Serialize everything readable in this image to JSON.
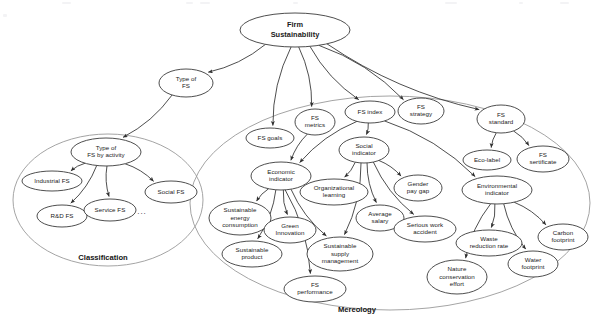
{
  "diagram": {
    "type": "ontology-concept-map",
    "root": {
      "id": "firm-sustainability",
      "label_line1": "Firm",
      "label_line2": "Sustainability"
    },
    "groups": [
      {
        "id": "classification",
        "label": "Classification"
      },
      {
        "id": "mereology",
        "label": "Mereology"
      }
    ],
    "ellipsis": "...",
    "nodes": [
      {
        "id": "firm-sustainability",
        "lines": [
          "Firm",
          "Sustainability"
        ],
        "cx": 295,
        "cy": 30,
        "rx": 55,
        "ry": 17,
        "bold": true
      },
      {
        "id": "type-of-fs",
        "lines": [
          "Type of",
          "FS"
        ],
        "cx": 186,
        "cy": 83,
        "rx": 27,
        "ry": 14
      },
      {
        "id": "type-of-fs-by-activity",
        "lines": [
          "Type of",
          "FS by activity"
        ],
        "cx": 106,
        "cy": 152,
        "rx": 35,
        "ry": 14
      },
      {
        "id": "industrial-fs",
        "lines": [
          "Industrial FS"
        ],
        "cx": 52,
        "cy": 181,
        "rx": 30,
        "ry": 10
      },
      {
        "id": "rd-fs",
        "lines": [
          "R&D FS"
        ],
        "cx": 62,
        "cy": 216,
        "rx": 25,
        "ry": 11
      },
      {
        "id": "service-fs",
        "lines": [
          "Service FS"
        ],
        "cx": 110,
        "cy": 210,
        "rx": 26,
        "ry": 11
      },
      {
        "id": "social-fs",
        "lines": [
          "Social FS"
        ],
        "cx": 171,
        "cy": 192,
        "rx": 26,
        "ry": 11
      },
      {
        "id": "fs-goals",
        "lines": [
          "FS goals"
        ],
        "cx": 270,
        "cy": 138,
        "rx": 24,
        "ry": 10
      },
      {
        "id": "fs-metrics",
        "lines": [
          "FS",
          "metrics"
        ],
        "cx": 315,
        "cy": 122,
        "rx": 20,
        "ry": 13
      },
      {
        "id": "fs-index",
        "lines": [
          "FS index"
        ],
        "cx": 370,
        "cy": 112,
        "rx": 25,
        "ry": 11
      },
      {
        "id": "fs-strategy",
        "lines": [
          "FS",
          "strategy"
        ],
        "cx": 421,
        "cy": 111,
        "rx": 23,
        "ry": 13
      },
      {
        "id": "fs-standard",
        "lines": [
          "FS",
          "standard"
        ],
        "cx": 501,
        "cy": 119,
        "rx": 24,
        "ry": 14
      },
      {
        "id": "eco-label",
        "lines": [
          "Eco-label"
        ],
        "cx": 487,
        "cy": 160,
        "rx": 24,
        "ry": 10
      },
      {
        "id": "fs-sertificate",
        "lines": [
          "FS",
          "sertificate"
        ],
        "cx": 543,
        "cy": 159,
        "rx": 26,
        "ry": 13
      },
      {
        "id": "social-indicator",
        "lines": [
          "Social",
          "indicator"
        ],
        "cx": 364,
        "cy": 150,
        "rx": 25,
        "ry": 13
      },
      {
        "id": "economic-indicator",
        "lines": [
          "Economic",
          "indicator"
        ],
        "cx": 281,
        "cy": 176,
        "rx": 30,
        "ry": 14
      },
      {
        "id": "organizational-learning",
        "lines": [
          "Organizational",
          "learning"
        ],
        "cx": 334,
        "cy": 192,
        "rx": 34,
        "ry": 13
      },
      {
        "id": "gender-pay-gap",
        "lines": [
          "Gender",
          "pay gap"
        ],
        "cx": 418,
        "cy": 188,
        "rx": 24,
        "ry": 13
      },
      {
        "id": "environmental-indicator",
        "lines": [
          "Environmental",
          "indicator"
        ],
        "cx": 497,
        "cy": 190,
        "rx": 35,
        "ry": 14
      },
      {
        "id": "sustainable-energy-consumption",
        "lines": [
          "Sustainable",
          "energy",
          "consumption"
        ],
        "cx": 240,
        "cy": 218,
        "rx": 31,
        "ry": 17
      },
      {
        "id": "green-innovation",
        "lines": [
          "Green",
          "Innovation"
        ],
        "cx": 290,
        "cy": 230,
        "rx": 26,
        "ry": 13
      },
      {
        "id": "average-salary",
        "lines": [
          "Average",
          "salary"
        ],
        "cx": 380,
        "cy": 218,
        "rx": 24,
        "ry": 13
      },
      {
        "id": "serious-work-accident",
        "lines": [
          "Serious work",
          "accident"
        ],
        "cx": 425,
        "cy": 229,
        "rx": 31,
        "ry": 13
      },
      {
        "id": "waste-reduction-rate",
        "lines": [
          "Waste",
          "reduction rate"
        ],
        "cx": 489,
        "cy": 243,
        "rx": 33,
        "ry": 13
      },
      {
        "id": "carbon-footprint",
        "lines": [
          "Carbon",
          "footprint"
        ],
        "cx": 563,
        "cy": 237,
        "rx": 25,
        "ry": 13
      },
      {
        "id": "water-footprint",
        "lines": [
          "Water",
          "footprint"
        ],
        "cx": 533,
        "cy": 264,
        "rx": 25,
        "ry": 13
      },
      {
        "id": "nature-conservation-effort",
        "lines": [
          "Nature",
          "conservation",
          "effort"
        ],
        "cx": 457,
        "cy": 277,
        "rx": 30,
        "ry": 17
      },
      {
        "id": "sustainable-product",
        "lines": [
          "Sustainable",
          "product"
        ],
        "cx": 252,
        "cy": 254,
        "rx": 30,
        "ry": 13
      },
      {
        "id": "sustainable-supply-management",
        "lines": [
          "Sustainable",
          "supply",
          "management"
        ],
        "cx": 340,
        "cy": 254,
        "rx": 33,
        "ry": 17
      },
      {
        "id": "fs-performance",
        "lines": [
          "FS",
          "performance"
        ],
        "cx": 315,
        "cy": 289,
        "rx": 31,
        "ry": 13
      }
    ],
    "edges": [
      {
        "from": "firm-sustainability",
        "to": "type-of-fs"
      },
      {
        "from": "firm-sustainability",
        "to": "fs-goals"
      },
      {
        "from": "firm-sustainability",
        "to": "fs-metrics"
      },
      {
        "from": "firm-sustainability",
        "to": "fs-index"
      },
      {
        "from": "firm-sustainability",
        "to": "fs-strategy"
      },
      {
        "from": "firm-sustainability",
        "to": "fs-standard"
      },
      {
        "from": "type-of-fs",
        "to": "type-of-fs-by-activity"
      },
      {
        "from": "type-of-fs-by-activity",
        "to": "industrial-fs"
      },
      {
        "from": "type-of-fs-by-activity",
        "to": "rd-fs"
      },
      {
        "from": "type-of-fs-by-activity",
        "to": "service-fs"
      },
      {
        "from": "type-of-fs-by-activity",
        "to": "social-fs"
      },
      {
        "from": "fs-metrics",
        "to": "economic-indicator"
      },
      {
        "from": "fs-index",
        "to": "social-indicator"
      },
      {
        "from": "fs-index",
        "to": "economic-indicator"
      },
      {
        "from": "fs-index",
        "to": "environmental-indicator"
      },
      {
        "from": "fs-standard",
        "to": "eco-label"
      },
      {
        "from": "fs-standard",
        "to": "fs-sertificate"
      },
      {
        "from": "economic-indicator",
        "to": "sustainable-energy-consumption"
      },
      {
        "from": "economic-indicator",
        "to": "sustainable-product"
      },
      {
        "from": "economic-indicator",
        "to": "green-innovation"
      },
      {
        "from": "economic-indicator",
        "to": "fs-performance"
      },
      {
        "from": "economic-indicator",
        "to": "sustainable-supply-management"
      },
      {
        "from": "social-indicator",
        "to": "organizational-learning"
      },
      {
        "from": "social-indicator",
        "to": "average-salary"
      },
      {
        "from": "social-indicator",
        "to": "gender-pay-gap"
      },
      {
        "from": "social-indicator",
        "to": "serious-work-accident"
      },
      {
        "from": "social-indicator",
        "to": "sustainable-supply-management"
      },
      {
        "from": "environmental-indicator",
        "to": "nature-conservation-effort"
      },
      {
        "from": "environmental-indicator",
        "to": "waste-reduction-rate"
      },
      {
        "from": "environmental-indicator",
        "to": "water-footprint"
      },
      {
        "from": "environmental-indicator",
        "to": "carbon-footprint"
      }
    ]
  }
}
